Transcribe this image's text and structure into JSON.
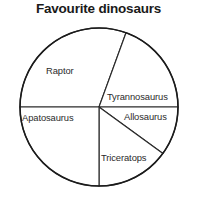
{
  "chart_data": {
    "type": "pie",
    "title": "Favourite dinosaurs",
    "xlabel": "",
    "ylabel": "",
    "legend": "none",
    "grid": false,
    "labels_inside": true,
    "center": {
      "x": 99,
      "y": 107
    },
    "radius": 79,
    "categories": [
      "Raptor",
      "Tyrannosaurus",
      "Allosaurus",
      "Triceratops",
      "Apatosaurus"
    ],
    "values": [
      110,
      70,
      36,
      54,
      90
    ],
    "value_unit": "degrees",
    "percentages": [
      30.6,
      19.4,
      10.0,
      15.0,
      25.0
    ],
    "slices": [
      {
        "name": "Raptor",
        "start_angle": 270,
        "end_angle": 380,
        "sweep": 110,
        "percent": 30.6,
        "color": "#ffffff"
      },
      {
        "name": "Tyrannosaurus",
        "start_angle": 20,
        "end_angle": 90,
        "sweep": 70,
        "percent": 19.4,
        "color": "#ffffff"
      },
      {
        "name": "Allosaurus",
        "start_angle": 90,
        "end_angle": 126,
        "sweep": 36,
        "percent": 10.0,
        "color": "#ffffff"
      },
      {
        "name": "Triceratops",
        "start_angle": 126,
        "end_angle": 180,
        "sweep": 54,
        "percent": 15.0,
        "color": "#ffffff"
      },
      {
        "name": "Apatosaurus",
        "start_angle": 180,
        "end_angle": 270,
        "sweep": 90,
        "percent": 25.0,
        "color": "#ffffff"
      }
    ]
  },
  "chart": {
    "title": "Favourite dinosaurs",
    "labels": {
      "raptor": "Raptor",
      "tyrannosaurus": "Tyrannosaurus",
      "allosaurus": "Allosaurus",
      "triceratops": "Triceratops",
      "apatosaurus": "Apatosaurus"
    }
  },
  "colors": {
    "background": "#ffffff",
    "outline": "#1b1b1b",
    "divider": "#2b2b2b",
    "title_text": "#1a1a1a",
    "label_text": "#2b2b2b"
  }
}
